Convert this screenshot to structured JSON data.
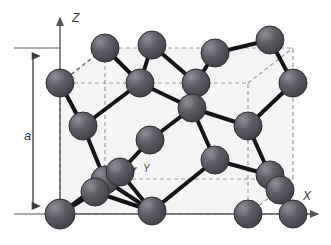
{
  "figure": {
    "background_color": "#ffffff",
    "cell_fill_color": "#f2f2f2"
  },
  "axes": {
    "x_label": "X",
    "y_label": "Y",
    "z_label": "Z",
    "axis_color": "#555555",
    "origin": {
      "x": 60,
      "y": 214
    },
    "x_axis_end": {
      "x": 322,
      "y": 214
    },
    "z_axis_end": {
      "x": 60,
      "y": 14
    },
    "y_axis_end": {
      "x": 140,
      "y": 165
    }
  },
  "dimension": {
    "label": "a",
    "color": "#3a3a3a",
    "top_y": 48,
    "bottom_y": 214,
    "arrow_x": 33,
    "tick_left_x": 14,
    "tick_right_x": 60,
    "label_x": 27,
    "label_y": 136
  },
  "unit_cell": {
    "dash_color": "#9a9aa2",
    "dash_pattern": "4,3",
    "front_face": {
      "left": 60,
      "right": 248,
      "top": 83,
      "bottom": 214
    },
    "depth_offset": {
      "dx": 45,
      "dy": -35
    }
  },
  "atoms": {
    "fill_dark": "#4a4a52",
    "fill_mid": "#5e5e66",
    "fill_light": "#8f8f99",
    "stroke": "#2c2c32",
    "radius": 14,
    "count": 22,
    "positions": [
      {
        "id": "a1",
        "cx": 60,
        "cy": 214,
        "r": 15,
        "note": "origin-corner-front-bottom-left"
      },
      {
        "id": "a2",
        "cx": 105,
        "cy": 180,
        "r": 14,
        "note": "body-lower-left"
      },
      {
        "id": "a3",
        "cx": 95,
        "cy": 192,
        "r": 14,
        "note": "body-lower-left-behind"
      },
      {
        "id": "a4",
        "cx": 152,
        "cy": 211,
        "r": 14,
        "note": "front-bottom-mid"
      },
      {
        "id": "a5",
        "cx": 248,
        "cy": 214,
        "r": 14,
        "note": "front-bottom-right"
      },
      {
        "id": "a6",
        "cx": 60,
        "cy": 83,
        "r": 14,
        "note": "front-top-left-corner"
      },
      {
        "id": "a7",
        "cx": 83,
        "cy": 126,
        "r": 14,
        "note": "left-face-center"
      },
      {
        "id": "a8",
        "cx": 105,
        "cy": 48,
        "r": 14,
        "note": "back-top-left"
      },
      {
        "id": "a9",
        "cx": 140,
        "cy": 83,
        "r": 14,
        "note": "upper-left-interior"
      },
      {
        "id": "a10",
        "cx": 152,
        "cy": 45,
        "r": 14,
        "note": "top-face-mid-left"
      },
      {
        "id": "a11",
        "cx": 196,
        "cy": 83,
        "r": 14,
        "note": "top-interior-right"
      },
      {
        "id": "a12",
        "cx": 192,
        "cy": 108,
        "r": 14,
        "note": "body-center-upper"
      },
      {
        "id": "a13",
        "cx": 215,
        "cy": 53,
        "r": 14,
        "note": "back-top-mid-right"
      },
      {
        "id": "a14",
        "cx": 270,
        "cy": 40,
        "r": 14,
        "note": "back-top-right"
      },
      {
        "id": "a15",
        "cx": 293,
        "cy": 83,
        "r": 14,
        "note": "right-upper-edge"
      },
      {
        "id": "a16",
        "cx": 248,
        "cy": 126,
        "r": 14,
        "note": "right-face-center"
      },
      {
        "id": "a17",
        "cx": 150,
        "cy": 140,
        "r": 14,
        "note": "interior-left-lower"
      },
      {
        "id": "a18",
        "cx": 215,
        "cy": 160,
        "r": 14,
        "note": "interior-right-lower"
      },
      {
        "id": "a19",
        "cx": 270,
        "cy": 175,
        "r": 14,
        "note": "right-lower-front"
      },
      {
        "id": "a20",
        "cx": 280,
        "cy": 190,
        "r": 14,
        "note": "right-lower-behind"
      },
      {
        "id": "a21",
        "cx": 120,
        "cy": 172,
        "r": 14,
        "note": "lower-left-node"
      },
      {
        "id": "a22",
        "cx": 293,
        "cy": 214,
        "r": 14,
        "note": "bottom-right-outer"
      }
    ]
  },
  "bonds": {
    "color": "#141418",
    "width": 4,
    "pairs": [
      [
        "a1",
        "a2"
      ],
      [
        "a1",
        "a3"
      ],
      [
        "a2",
        "a4"
      ],
      [
        "a3",
        "a4"
      ],
      [
        "a2",
        "a7"
      ],
      [
        "a7",
        "a6"
      ],
      [
        "a8",
        "a9"
      ],
      [
        "a9",
        "a7"
      ],
      [
        "a9",
        "a10"
      ],
      [
        "a10",
        "a11"
      ],
      [
        "a11",
        "a12"
      ],
      [
        "a12",
        "a17"
      ],
      [
        "a12",
        "a16"
      ],
      [
        "a11",
        "a13"
      ],
      [
        "a13",
        "a14"
      ],
      [
        "a14",
        "a15"
      ],
      [
        "a15",
        "a16"
      ],
      [
        "a16",
        "a19"
      ],
      [
        "a19",
        "a20"
      ],
      [
        "a19",
        "a22"
      ],
      [
        "a20",
        "a22"
      ],
      [
        "a17",
        "a21"
      ],
      [
        "a21",
        "a4"
      ],
      [
        "a18",
        "a12"
      ],
      [
        "a18",
        "a19"
      ],
      [
        "a18",
        "a4"
      ],
      [
        "a9",
        "a12"
      ],
      [
        "a21",
        "a2"
      ]
    ],
    "dashed_pairs": [
      [
        "a6",
        "a8"
      ],
      [
        "a13",
        "a14"
      ],
      [
        "a5",
        "a22"
      ]
    ]
  }
}
